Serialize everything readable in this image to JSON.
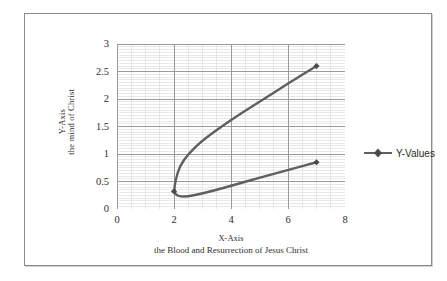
{
  "chart_data": {
    "type": "line",
    "title": "",
    "xlabel": "X-Axis",
    "xlabel_sub": "the Blood and Resurrection of Jesus Christ",
    "ylabel": "Y-Axis",
    "ylabel_sub": "the mind of Christ",
    "xlim": [
      0,
      8
    ],
    "ylim": [
      0,
      3
    ],
    "x_ticks": [
      "0",
      "2",
      "4",
      "6",
      "8"
    ],
    "x_tick_values": [
      0,
      2,
      4,
      6,
      8
    ],
    "y_ticks": [
      "0",
      "0.5",
      "1",
      "1.5",
      "2",
      "2.5",
      "3"
    ],
    "y_tick_values": [
      0,
      0.5,
      1,
      1.5,
      2,
      2.5,
      3
    ],
    "x_minor_step": 0.5,
    "y_minor_step": 0.05,
    "grid": true,
    "grid_major_color": "#9a9a9a",
    "grid_minor_color": "#d8d8d8",
    "legend_position": "right",
    "series": [
      {
        "name": "Y-Values",
        "color": "#5f5f5f",
        "marker": "diamond",
        "x": [
          7.0,
          6.0,
          5.0,
          4.0,
          3.0,
          2.5,
          2.2,
          2.05,
          2.0,
          2.1,
          2.4,
          3.0,
          4.0,
          5.0,
          6.0,
          7.0
        ],
        "y": [
          2.6,
          2.28,
          1.95,
          1.62,
          1.25,
          1.0,
          0.78,
          0.52,
          0.32,
          0.24,
          0.22,
          0.28,
          0.42,
          0.57,
          0.71,
          0.85
        ],
        "marker_points": [
          {
            "x": 7.0,
            "y": 2.6
          },
          {
            "x": 2.0,
            "y": 0.32
          },
          {
            "x": 7.0,
            "y": 0.85
          }
        ]
      }
    ]
  },
  "legend": {
    "entries": [
      {
        "label": "Y-Values",
        "color": "#5f5f5f"
      }
    ]
  }
}
